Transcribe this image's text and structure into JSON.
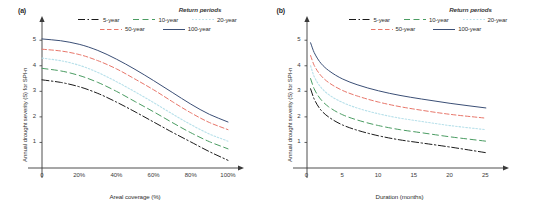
{
  "figure": {
    "background": "#ffffff",
    "panels": [
      "a",
      "b"
    ]
  },
  "series_styles": {
    "5-year": {
      "color": "#1a1a1a",
      "dash": "7,2.5,1.5,2.5",
      "width": 1.0
    },
    "10-year": {
      "color": "#4a9c62",
      "dash": "6,3.5",
      "width": 1.0
    },
    "20-year": {
      "color": "#b7e0ea",
      "dash": "1.6,1.8",
      "width": 1.1
    },
    "50-year": {
      "color": "#e8766a",
      "dash": "4.5,2.5",
      "width": 1.0
    },
    "100-year": {
      "color": "#3b4f76",
      "dash": "none",
      "width": 1.0
    }
  },
  "legend": {
    "title": "Return periods",
    "rows": [
      [
        {
          "label": "5-year",
          "style": "5-year"
        },
        {
          "label": "10-year",
          "style": "10-year"
        },
        {
          "label": "20-year",
          "style": "20-year"
        }
      ],
      [
        {
          "label": "50-year",
          "style": "50-year"
        },
        {
          "label": "100-year",
          "style": "100-year"
        }
      ]
    ]
  },
  "panel_a": {
    "label": "(a)",
    "xlabel": "Areal coverage (%)",
    "ylabel": "Annual drought severity (S) for SPI-n",
    "xticks": [
      "0",
      "20%",
      "40%",
      "60%",
      "80%",
      "100%"
    ],
    "yticks": [
      "1",
      "2",
      "3",
      "4",
      "5"
    ]
  },
  "panel_b": {
    "label": "(b)",
    "xlabel": "Duration (months)",
    "ylabel": "Annual drought severity (S) for SPI-n",
    "xticks": [
      "0",
      "5",
      "10",
      "15",
      "20",
      "25"
    ],
    "yticks": [
      "1",
      "2",
      "3",
      "4",
      "5"
    ]
  },
  "chart_data": [
    {
      "type": "line",
      "panel": "(a)",
      "title": "",
      "xlabel": "Areal coverage (%)",
      "ylabel": "Annual drought severity (S) for SPI-n",
      "xlim": [
        0,
        100
      ],
      "ylim": [
        0,
        5.4
      ],
      "xticks": [
        0,
        20,
        40,
        60,
        80,
        100
      ],
      "xticklabels": [
        "0",
        "20%",
        "40%",
        "60%",
        "80%",
        "100%"
      ],
      "yticks": [
        1,
        2,
        3,
        4,
        5
      ],
      "grid": false,
      "legend_position": "top-right-outside",
      "legend_title": "Return periods",
      "x": [
        0,
        10,
        20,
        30,
        40,
        50,
        60,
        70,
        80,
        90,
        100
      ],
      "series": [
        {
          "name": "5-year",
          "values": [
            3.45,
            3.35,
            3.18,
            2.92,
            2.58,
            2.2,
            1.8,
            1.4,
            1.02,
            0.64,
            0.3
          ]
        },
        {
          "name": "10-year",
          "values": [
            3.9,
            3.8,
            3.62,
            3.35,
            3.0,
            2.6,
            2.2,
            1.78,
            1.38,
            1.03,
            0.75
          ]
        },
        {
          "name": "20-year",
          "values": [
            4.3,
            4.2,
            4.02,
            3.74,
            3.38,
            2.98,
            2.56,
            2.12,
            1.7,
            1.33,
            1.05
          ]
        },
        {
          "name": "50-year",
          "values": [
            4.65,
            4.58,
            4.44,
            4.2,
            3.88,
            3.48,
            3.06,
            2.6,
            2.16,
            1.78,
            1.5
          ]
        },
        {
          "name": "100-year",
          "values": [
            5.05,
            4.98,
            4.84,
            4.6,
            4.26,
            3.86,
            3.42,
            2.96,
            2.5,
            2.1,
            1.8
          ]
        }
      ]
    },
    {
      "type": "line",
      "panel": "(b)",
      "title": "",
      "xlabel": "Duration (months)",
      "ylabel": "Annual drought severity (S) for SPI-n",
      "xlim": [
        0,
        26
      ],
      "ylim": [
        0,
        5.4
      ],
      "xticks": [
        0,
        5,
        10,
        15,
        20,
        25
      ],
      "xticklabels": [
        "0",
        "5",
        "10",
        "15",
        "20",
        "25"
      ],
      "yticks": [
        1,
        2,
        3,
        4,
        5
      ],
      "grid": false,
      "legend_position": "top-right-outside",
      "legend_title": "Return periods",
      "x": [
        0.5,
        1,
        2,
        3,
        5,
        7,
        10,
        13,
        16,
        20,
        25
      ],
      "series": [
        {
          "name": "5-year",
          "values": [
            3.1,
            2.7,
            2.25,
            2.0,
            1.68,
            1.48,
            1.26,
            1.1,
            0.98,
            0.82,
            0.6
          ]
        },
        {
          "name": "10-year",
          "values": [
            3.5,
            3.1,
            2.66,
            2.4,
            2.08,
            1.88,
            1.66,
            1.5,
            1.38,
            1.22,
            1.05
          ]
        },
        {
          "name": "20-year",
          "values": [
            4.0,
            3.58,
            3.14,
            2.88,
            2.56,
            2.35,
            2.12,
            1.95,
            1.82,
            1.66,
            1.5
          ]
        },
        {
          "name": "50-year",
          "values": [
            4.4,
            4.02,
            3.6,
            3.35,
            3.03,
            2.82,
            2.58,
            2.4,
            2.26,
            2.1,
            1.95
          ]
        },
        {
          "name": "100-year",
          "values": [
            4.9,
            4.52,
            4.08,
            3.82,
            3.48,
            3.26,
            3.02,
            2.84,
            2.7,
            2.53,
            2.35
          ]
        }
      ]
    }
  ]
}
